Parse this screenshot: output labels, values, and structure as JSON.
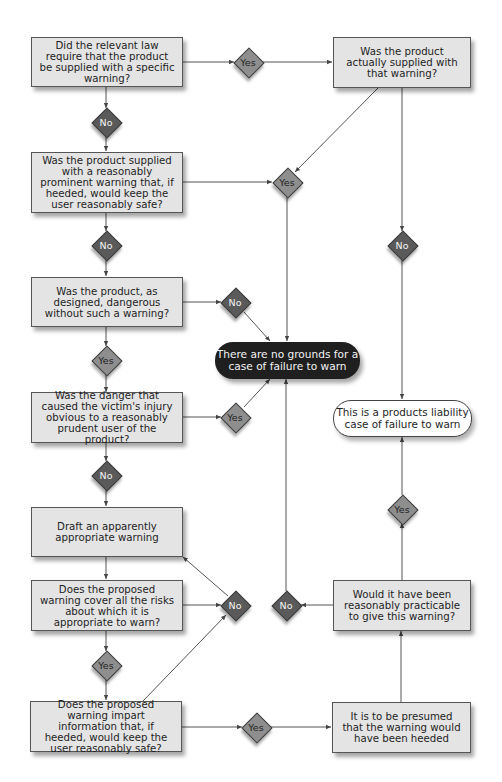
{
  "diagram": {
    "colors": {
      "box_fill": "#e4e4e4",
      "no_diamond": "#5a5a5a",
      "yes_diamond": "#8e8e8e",
      "terminal_dark": "#1f1f1f",
      "terminal_light": "#ffffff",
      "edge": "#444444"
    },
    "nodes": {
      "q_law_required": "Did the relevant law require that the product be supplied with a specific warning?",
      "q_actually_supplied": "Was the product actually supplied with that warning?",
      "q_prominent_warning": "Was the product supplied with a reasonably prominent warning that, if heeded, would keep the user reasonably safe?",
      "q_dangerous": "Was the product, as designed, dangerous without such a warning?",
      "q_obvious": "Was the danger that caused the victim's injury obvious to a reasonably prudent user of the product?",
      "draft_warning": "Draft an apparently appropriate warning",
      "q_cover_risks": "Does the proposed warning cover all the risks about which it is appropriate to warn?",
      "q_impart_info": "Does the proposed warning impart information that, if heeded, would keep the user reasonably safe?",
      "presumed_heeded": "It is to be presumed that the warning would have been heeded",
      "q_practicable": "Would it have been reasonably practicable to give this warning?",
      "end_no_grounds": "There are no grounds for a case of failure to warn",
      "end_liability": "This is a products liability case of failure to warn"
    },
    "decisions": {
      "d1": "Yes",
      "d2": "No",
      "d3": "Yes",
      "d4": "No",
      "d5": "No",
      "d6": "No",
      "d7": "Yes",
      "d8": "Yes",
      "d9": "No",
      "d10": "Yes",
      "d11": "No",
      "d12": "No",
      "d13": "Yes",
      "d14": "Yes"
    }
  }
}
